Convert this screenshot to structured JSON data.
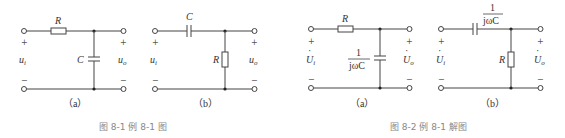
{
  "figures": [
    {
      "caption": "图 8-1   例 8-1 图",
      "circuits": [
        {
          "id": "a",
          "label": "（a）",
          "series": "R",
          "shunt": "C",
          "input": "u",
          "input_sub": "i",
          "output": "u",
          "output_sub": "o"
        },
        {
          "id": "b",
          "label": "（b）",
          "series": "C",
          "shunt": "R",
          "input": "u",
          "input_sub": "i",
          "output": "u",
          "output_sub": "o"
        }
      ]
    },
    {
      "caption": "图 8-2   例 8-1 解图",
      "circuits": [
        {
          "id": "a",
          "label": "（a）",
          "series": "R",
          "shunt_num": "1",
          "shunt_den": "jωC",
          "input": "U",
          "input_sub": "i",
          "output": "U",
          "output_sub": "o"
        },
        {
          "id": "b",
          "label": "（b）",
          "series_num": "1",
          "series_den": "jωC",
          "shunt": "R",
          "input": "U",
          "input_sub": "i",
          "output": "U",
          "output_sub": "o"
        }
      ]
    }
  ],
  "symbols": {
    "plus": "+",
    "minus": "−",
    "dot": "·"
  }
}
